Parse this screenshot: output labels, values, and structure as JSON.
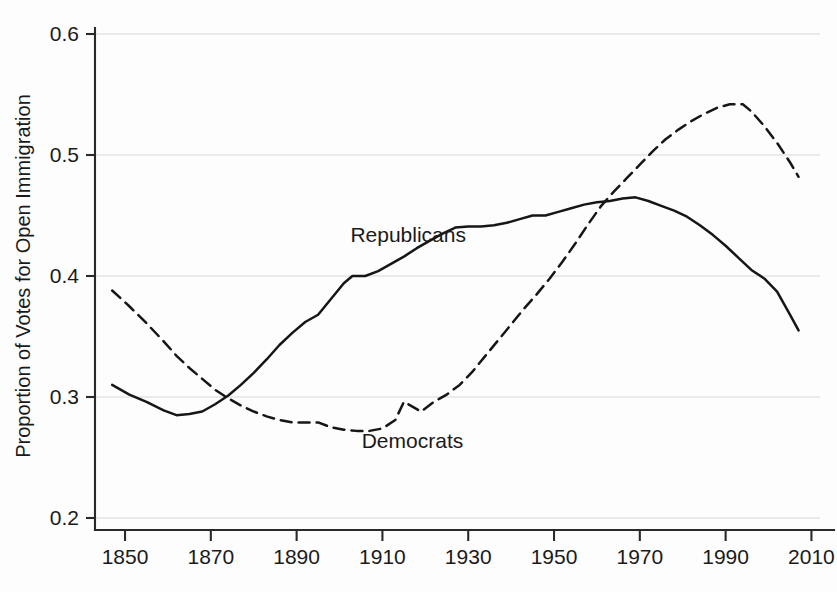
{
  "figure": {
    "background_color": "#fdfdfd",
    "line_color": "#161616",
    "grid_color": "#d8d8d8",
    "axis_color": "#2a2a2a"
  },
  "chart_data": {
    "type": "line",
    "title": "",
    "xlabel": "",
    "ylabel": "Proportion of Votes for Open Immigration",
    "xlim": [
      1843,
      2012
    ],
    "ylim": [
      0.2,
      0.6
    ],
    "xticks": [
      1850,
      1870,
      1890,
      1910,
      1930,
      1950,
      1970,
      1990,
      2010
    ],
    "xticklabels": [
      "1850",
      "1870",
      "1890",
      "1910",
      "1930",
      "1950",
      "1970",
      "1990",
      "2010"
    ],
    "yticks": [
      0.2,
      0.3,
      0.4,
      0.5,
      0.6
    ],
    "yticklabels": [
      "0.2",
      "0.3",
      "0.4",
      "0.5",
      "0.6"
    ],
    "grid": "horizontal",
    "legend_position": "inline-annotation",
    "series": [
      {
        "name": "Republicans",
        "style": "solid",
        "label_x": 1916,
        "label_y": 0.428,
        "x": [
          1847,
          1851,
          1855,
          1859,
          1862,
          1865,
          1868,
          1871,
          1874,
          1877,
          1880,
          1883,
          1886,
          1889,
          1892,
          1895,
          1898,
          1901,
          1903,
          1906,
          1909,
          1912,
          1915,
          1918,
          1921,
          1924,
          1927,
          1930,
          1933,
          1936,
          1939,
          1942,
          1945,
          1948,
          1951,
          1954,
          1957,
          1960,
          1963,
          1966,
          1969,
          1972,
          1975,
          1978,
          1981,
          1984,
          1987,
          1990,
          1993,
          1996,
          1999,
          2002,
          2005,
          2007
        ],
        "y": [
          0.31,
          0.302,
          0.296,
          0.289,
          0.285,
          0.286,
          0.288,
          0.294,
          0.301,
          0.31,
          0.32,
          0.331,
          0.343,
          0.353,
          0.362,
          0.368,
          0.381,
          0.394,
          0.4,
          0.4,
          0.404,
          0.41,
          0.416,
          0.423,
          0.429,
          0.435,
          0.44,
          0.441,
          0.441,
          0.442,
          0.444,
          0.447,
          0.45,
          0.45,
          0.453,
          0.456,
          0.459,
          0.461,
          0.462,
          0.464,
          0.465,
          0.462,
          0.458,
          0.454,
          0.449,
          0.442,
          0.434,
          0.425,
          0.415,
          0.405,
          0.398,
          0.387,
          0.368,
          0.355
        ]
      },
      {
        "name": "Democrats",
        "style": "dashed",
        "label_x": 1917,
        "label_y": 0.258,
        "x": [
          1847,
          1851,
          1855,
          1859,
          1862,
          1865,
          1868,
          1871,
          1874,
          1877,
          1880,
          1883,
          1886,
          1889,
          1892,
          1895,
          1898,
          1901,
          1904,
          1907,
          1910,
          1913,
          1915,
          1917,
          1919,
          1922,
          1925,
          1928,
          1931,
          1934,
          1937,
          1940,
          1943,
          1946,
          1949,
          1952,
          1955,
          1958,
          1961,
          1964,
          1967,
          1970,
          1973,
          1976,
          1979,
          1982,
          1985,
          1988,
          1991,
          1994,
          1996,
          1999,
          2002,
          2005,
          2007
        ],
        "y": [
          0.388,
          0.375,
          0.361,
          0.346,
          0.334,
          0.324,
          0.315,
          0.306,
          0.299,
          0.293,
          0.288,
          0.284,
          0.281,
          0.279,
          0.279,
          0.279,
          0.275,
          0.273,
          0.272,
          0.272,
          0.274,
          0.281,
          0.296,
          0.292,
          0.288,
          0.296,
          0.302,
          0.31,
          0.321,
          0.334,
          0.347,
          0.36,
          0.373,
          0.385,
          0.398,
          0.412,
          0.427,
          0.443,
          0.458,
          0.47,
          0.481,
          0.492,
          0.503,
          0.513,
          0.521,
          0.528,
          0.534,
          0.539,
          0.542,
          0.542,
          0.536,
          0.524,
          0.51,
          0.494,
          0.482
        ]
      }
    ]
  }
}
